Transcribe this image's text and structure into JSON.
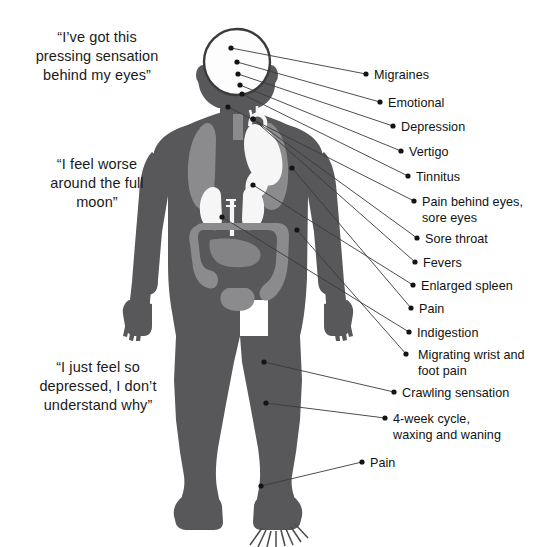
{
  "page": {
    "background": "#ffffff",
    "width": 549,
    "height": 547
  },
  "colors": {
    "body_fill": "#58585a",
    "body_outline": "#3d3d3f",
    "organ_light": "#8b8b8d",
    "organ_white": "#f6f6f6",
    "head_fill": "#fdfdfd",
    "head_outline": "#3b3b3d",
    "leader_line": "#3a3a3a",
    "dot": "#141414",
    "text": "#111111"
  },
  "quotes": [
    {
      "id": "quote-eyes",
      "text": "“I’ve got this\npressing sensation\nbehind my eyes”"
    },
    {
      "id": "quote-moon",
      "text": "“I feel worse\naround the full\nmoon”"
    },
    {
      "id": "quote-depressed",
      "text": "“I just feel so\ndepressed, I don’t\nunderstand why”"
    }
  ],
  "labels": [
    {
      "id": "label-migraines",
      "text": "Migraines",
      "dot": [
        366,
        74
      ],
      "text_x": 374,
      "text_y": 68,
      "source": [
        231,
        48
      ]
    },
    {
      "id": "label-emotional",
      "text": "Emotional",
      "dot": [
        380,
        102
      ],
      "text_x": 388,
      "text_y": 96,
      "source": [
        237,
        62
      ]
    },
    {
      "id": "label-depression",
      "text": "Depression",
      "dot": [
        393,
        126
      ],
      "text_x": 401,
      "text_y": 120,
      "source": [
        238,
        74
      ]
    },
    {
      "id": "label-vertigo",
      "text": "Vertigo",
      "dot": [
        401,
        151
      ],
      "text_x": 409,
      "text_y": 145,
      "source": [
        240,
        85
      ]
    },
    {
      "id": "label-tinnitus",
      "text": "Tinnitus",
      "dot": [
        408,
        176
      ],
      "text_x": 416,
      "text_y": 170,
      "source": [
        242,
        94
      ]
    },
    {
      "id": "label-pain-eyes",
      "text": "Pain behind eyes,\nsore eyes",
      "dot": [
        414,
        201
      ],
      "text_x": 422,
      "text_y": 195,
      "source": [
        228,
        107
      ]
    },
    {
      "id": "label-sore-throat",
      "text": "Sore throat",
      "dot": [
        417,
        238
      ],
      "text_x": 425,
      "text_y": 232,
      "source": [
        253,
        119
      ]
    },
    {
      "id": "label-fevers",
      "text": "Fevers",
      "dot": [
        415,
        262
      ],
      "text_x": 423,
      "text_y": 256,
      "source": [
        253,
        119
      ]
    },
    {
      "id": "label-spleen",
      "text": "Enlarged spleen",
      "dot": [
        413,
        285
      ],
      "text_x": 421,
      "text_y": 279,
      "source": [
        253,
        185
      ]
    },
    {
      "id": "label-pain-1",
      "text": "Pain",
      "dot": [
        411,
        308
      ],
      "text_x": 419,
      "text_y": 302,
      "source": [
        292,
        168
      ]
    },
    {
      "id": "label-indigestion",
      "text": "Indigestion",
      "dot": [
        409,
        332
      ],
      "text_x": 417,
      "text_y": 326,
      "source": [
        222,
        217
      ]
    },
    {
      "id": "label-migrating",
      "text": "Migrating wrist and\nfoot pain",
      "dot": [
        406,
        354
      ],
      "text_x": 418,
      "text_y": 348,
      "source": [
        297,
        230
      ]
    },
    {
      "id": "label-crawling",
      "text": "Crawling sensation",
      "dot": [
        394,
        392
      ],
      "text_x": 402,
      "text_y": 386,
      "source": [
        264,
        362
      ]
    },
    {
      "id": "label-4week",
      "text": "4-week cycle,\nwaxing and waning",
      "dot": [
        385,
        418
      ],
      "text_x": 393,
      "text_y": 412,
      "source": [
        266,
        403
      ]
    },
    {
      "id": "label-pain-2",
      "text": "Pain",
      "dot": [
        362,
        462
      ],
      "text_x": 370,
      "text_y": 456,
      "source": [
        261,
        486
      ]
    }
  ],
  "anatomy": {
    "parts": [
      {
        "name": "head-outline",
        "kind": "head"
      },
      {
        "name": "brain-cavity",
        "kind": "head-fill"
      },
      {
        "name": "torso",
        "kind": "body"
      },
      {
        "name": "left-lung",
        "kind": "organ-light"
      },
      {
        "name": "right-lung",
        "kind": "organ-light"
      },
      {
        "name": "heart",
        "kind": "organ-white"
      },
      {
        "name": "left-kidney",
        "kind": "organ-white"
      },
      {
        "name": "right-kidney",
        "kind": "organ-white"
      },
      {
        "name": "spleen",
        "kind": "organ-white"
      },
      {
        "name": "colon",
        "kind": "organ-light"
      },
      {
        "name": "left-arm",
        "kind": "body"
      },
      {
        "name": "right-arm",
        "kind": "body"
      },
      {
        "name": "left-leg",
        "kind": "body"
      },
      {
        "name": "right-leg",
        "kind": "body"
      },
      {
        "name": "foot-pain-burst",
        "kind": "burst"
      }
    ]
  }
}
